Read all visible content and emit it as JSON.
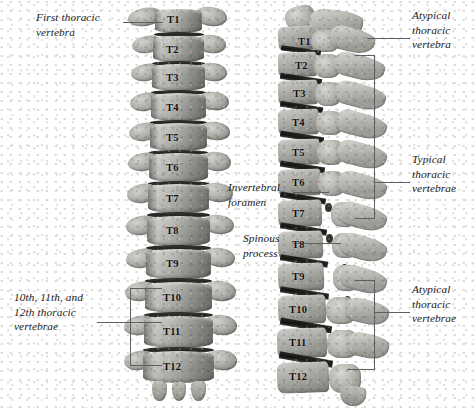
{
  "figure": {
    "background_color": "#ffffff",
    "bone_color": "#a6a6a1",
    "leader_color": "#5d5f63",
    "label_color": "#1a1a1a"
  },
  "panels": [
    {
      "id": "anterior",
      "view": "anterior",
      "vertebrae": [
        "T1",
        "T2",
        "T3",
        "T4",
        "T5",
        "T6",
        "T7",
        "T8",
        "T9",
        "T10",
        "T11",
        "T12"
      ]
    },
    {
      "id": "lateral",
      "view": "lateral",
      "vertebrae": [
        "T1",
        "T2",
        "T3",
        "T4",
        "T5",
        "T6",
        "T7",
        "T8",
        "T9",
        "T10",
        "T11",
        "T12"
      ]
    }
  ],
  "annotations": [
    {
      "id": "first-thoracic-vertebra",
      "text": "First thoracic\nvertebra",
      "side": "left",
      "panel": "anterior",
      "targets": [
        "T1"
      ],
      "style": "leader"
    },
    {
      "id": "lower-thoracic-vertebrae",
      "text": "10th, 11th, and\n12th thoracic\nvertebrae",
      "side": "left",
      "panel": "anterior",
      "targets": [
        "T10",
        "T11",
        "T12"
      ],
      "style": "bracket"
    },
    {
      "id": "atypical-thoracic-vertebra-upper",
      "text": "Atypical\nthoracic\nvertebra",
      "side": "right",
      "panel": "lateral",
      "targets": [
        "T1"
      ],
      "style": "leader"
    },
    {
      "id": "typical-thoracic-vertebrae",
      "text": "Typical\nthoracic\nvertebrae",
      "side": "right",
      "panel": "lateral",
      "targets": [
        "T2",
        "T3",
        "T4",
        "T5",
        "T6",
        "T7",
        "T8",
        "T9"
      ],
      "style": "bracket"
    },
    {
      "id": "atypical-thoracic-vertebrae-lower",
      "text": "Atypical\nthoracic\nvertebrae",
      "side": "right",
      "panel": "lateral",
      "targets": [
        "T10",
        "T11",
        "T12"
      ],
      "style": "bracket"
    },
    {
      "id": "invertebral-foramen",
      "text": "Invertebral\nforamen",
      "side": "left",
      "panel": "lateral",
      "targets": [
        "T7"
      ],
      "style": "leader"
    },
    {
      "id": "spinous-process",
      "text": "Spinous\nprocess",
      "side": "left",
      "panel": "lateral",
      "targets": [
        "T8"
      ],
      "style": "leader"
    }
  ]
}
